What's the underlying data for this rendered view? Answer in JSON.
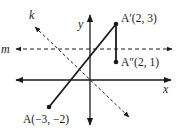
{
  "diagram": {
    "colors": {
      "stroke": "#1a1a1a",
      "background": "#ffffff"
    },
    "axes": {
      "x_label": "x",
      "y_label": "y"
    },
    "lines": {
      "k": {
        "label": "k",
        "style": "dashed"
      },
      "m": {
        "label": "m",
        "style": "dashed"
      }
    },
    "points": [
      {
        "id": "A",
        "label": "A(−3, −2)",
        "x": -3,
        "y": -2
      },
      {
        "id": "A_prime",
        "label": "A′(2, 3)",
        "x": 2,
        "y": 3
      },
      {
        "id": "A_double_prime",
        "label": "A″(2, 1)",
        "x": 2,
        "y": 1
      }
    ],
    "segments": [
      {
        "from": "A",
        "to": "A_prime"
      },
      {
        "from": "A_prime",
        "to": "A_double_prime"
      }
    ]
  }
}
